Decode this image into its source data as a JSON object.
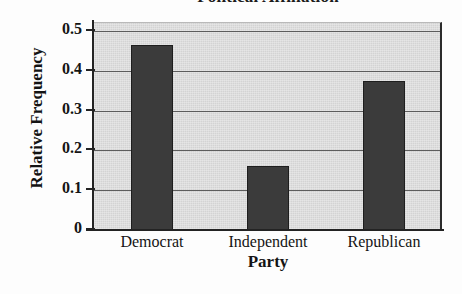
{
  "chart_data": {
    "type": "bar",
    "title": "Political Affiliation",
    "xlabel": "Party",
    "ylabel": "Relative Frequency",
    "categories": [
      "Democrat",
      "Independent",
      "Republican"
    ],
    "values": [
      0.465,
      0.162,
      0.375
    ],
    "ylim": [
      0,
      0.52
    ],
    "yticks": [
      0,
      0.1,
      0.2,
      0.3,
      0.4,
      0.5
    ],
    "ytick_labels": [
      "0",
      "0.1",
      "0.2",
      "0.3",
      "0.4",
      "0.5"
    ],
    "grid": true,
    "gridlines_at": [
      0.1,
      0.2,
      0.3,
      0.4,
      0.5
    ],
    "legend": null,
    "legend_position": "none",
    "bar_color": "#3b3b3b",
    "plot_background": "#d3d3d3",
    "gridline_color": "#5d5d5d",
    "axis_color": "#232323",
    "figure_background": "#fdfdfd"
  }
}
